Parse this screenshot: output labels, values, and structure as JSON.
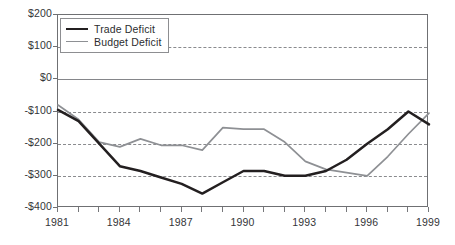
{
  "chart_data": {
    "type": "line",
    "title": "",
    "subtitle": "",
    "xlabel": "",
    "ylabel": "",
    "grid": true,
    "legend_position": "top-left",
    "x": [
      1981,
      1982,
      1983,
      1984,
      1985,
      1986,
      1987,
      1988,
      1989,
      1990,
      1991,
      1992,
      1993,
      1994,
      1995,
      1996,
      1997,
      1998,
      1999
    ],
    "xlim": [
      1981,
      1999
    ],
    "ylim": [
      -400,
      200
    ],
    "yticks": [
      200,
      100,
      0,
      -100,
      -200,
      -300,
      -400
    ],
    "ytick_labels": [
      "$200",
      "$100",
      "$0",
      "-$100",
      "-$200",
      "-$300",
      "-$400"
    ],
    "xticks": [
      1981,
      1982,
      1983,
      1984,
      1985,
      1986,
      1987,
      1988,
      1989,
      1990,
      1991,
      1992,
      1993,
      1994,
      1995,
      1996,
      1997,
      1998,
      1999
    ],
    "xtick_labels_shown": [
      "1981",
      "1984",
      "1987",
      "1990",
      "1993",
      "1996",
      "1999"
    ],
    "gridlines_dashed": [
      100,
      -100,
      -200,
      -300
    ],
    "gridlines_solid": [
      0
    ],
    "series": [
      {
        "name": "Trade Deficit",
        "color": "#231f20",
        "style": "solid-thick",
        "values": [
          -95,
          -130,
          -200,
          -270,
          -285,
          -305,
          -325,
          -355,
          -320,
          -285,
          -285,
          -300,
          -300,
          -285,
          -250,
          -200,
          -155,
          -100,
          -140
        ]
      },
      {
        "name": "Budget Deficit",
        "color": "#8e9094",
        "style": "solid-thin",
        "values": [
          -80,
          -125,
          -195,
          -210,
          -185,
          -205,
          -205,
          -220,
          -150,
          -155,
          -155,
          -195,
          -255,
          -280,
          -290,
          -300,
          -240,
          -170,
          -105
        ]
      }
    ]
  },
  "legend": {
    "items": [
      {
        "label": "Trade Deficit"
      },
      {
        "label": "Budget Deficit"
      }
    ]
  },
  "axes": {
    "y_labels": [
      "$200",
      "$100",
      "$0",
      "-$100",
      "-$200",
      "-$300",
      "-$400"
    ],
    "x_labels": [
      "1981",
      "1984",
      "1987",
      "1990",
      "1993",
      "1996",
      "1999"
    ]
  }
}
